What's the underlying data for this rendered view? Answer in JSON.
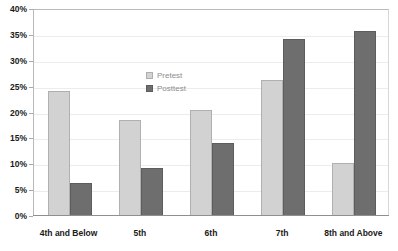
{
  "chart_data": {
    "type": "bar",
    "title": "",
    "subtitle": "",
    "xlabel": "",
    "ylabel": "",
    "categories": [
      "4th and Below",
      "5th",
      "6th",
      "7th",
      "8th and Above"
    ],
    "series": [
      {
        "name": "Pretest",
        "values": [
          24.2,
          18.5,
          20.5,
          26.2,
          10.3
        ],
        "color": "#d2d2d2"
      },
      {
        "name": "Posttest",
        "values": [
          6.4,
          9.3,
          14.1,
          34.2,
          35.7
        ],
        "color": "#6e6e6e"
      }
    ],
    "ylim": [
      0,
      40
    ],
    "yticks": [
      0,
      5,
      10,
      15,
      20,
      25,
      30,
      35,
      40
    ],
    "ytick_labels": [
      "0%",
      "5%",
      "10%",
      "15%",
      "20%",
      "25%",
      "30%",
      "35%",
      "40%"
    ],
    "value_suffix": "%",
    "grid": true,
    "grid_axis": "y",
    "legend": true,
    "legend_position": "inside-upper-center",
    "legend_entries": [
      "Pretest",
      "Posttest"
    ],
    "bar_orientation": "vertical",
    "grouping": "grouped"
  },
  "axis": {
    "y_tick_labels": [
      "40%",
      "35%",
      "30%",
      "25%",
      "20%",
      "15%",
      "10%",
      "5%",
      "0%"
    ],
    "x_tick_labels": [
      "4th and Below",
      "5th",
      "6th",
      "7th",
      "8th and Above"
    ]
  },
  "legend": {
    "items": [
      {
        "label": "Pretest",
        "swatch": "pretest-swatch"
      },
      {
        "label": "Posttest",
        "swatch": "posttest-swatch"
      }
    ]
  },
  "colors": {
    "pretest": "#d2d2d2",
    "posttest": "#6e6e6e",
    "grid": "#ececec",
    "axis": "#8f8f8f",
    "text": "#1a1a1a",
    "legend_text": "#8c8c8c",
    "background": "#ffffff"
  }
}
